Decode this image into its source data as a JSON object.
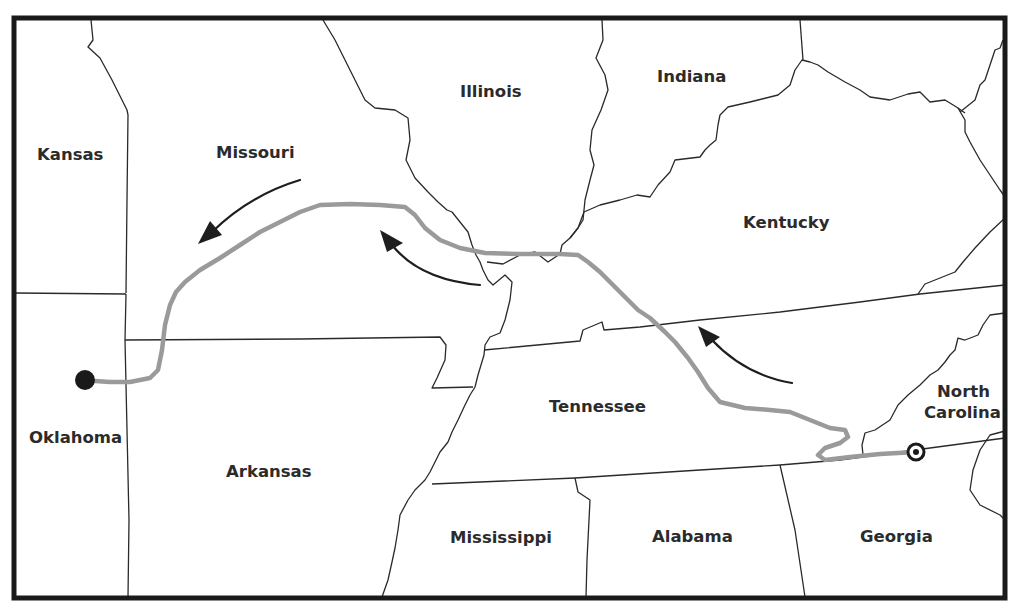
{
  "map": {
    "title": "",
    "states": [
      {
        "id": "kansas",
        "label": "Kansas"
      },
      {
        "id": "missouri",
        "label": "Missouri"
      },
      {
        "id": "illinois",
        "label": "Illinois"
      },
      {
        "id": "indiana",
        "label": "Indiana"
      },
      {
        "id": "kentucky",
        "label": "Kentucky"
      },
      {
        "id": "oklahoma",
        "label": "Oklahoma"
      },
      {
        "id": "arkansas",
        "label": "Arkansas"
      },
      {
        "id": "tennessee",
        "label": "Tennessee"
      },
      {
        "id": "north-carolina",
        "label_line1": "North",
        "label_line2": "Carolina"
      },
      {
        "id": "mississippi",
        "label": "Mississippi"
      },
      {
        "id": "alabama",
        "label": "Alabama"
      },
      {
        "id": "georgia",
        "label": "Georgia"
      }
    ],
    "route": {
      "description": "Gray route line from Georgia/North Carolina border westward through Tennessee, Kentucky, Illinois, Missouri to Oklahoma",
      "color": "#9a9a9a",
      "start_marker": "target-circle (bullseye) near Georgia/North Carolina/Tennessee border",
      "end_marker": "filled black dot in Oklahoma"
    },
    "arrows": [
      {
        "location": "Tennessee/Kentucky",
        "direction": "northwest"
      },
      {
        "location": "Missouri (east)",
        "direction": "west"
      },
      {
        "location": "Missouri (west)",
        "direction": "southwest"
      }
    ],
    "colors": {
      "background": "#ffffff",
      "borders": "#2a2a2a",
      "frame": "#1a1a1a",
      "route": "#9a9a9a",
      "arrows": "#1e1e1e"
    }
  }
}
